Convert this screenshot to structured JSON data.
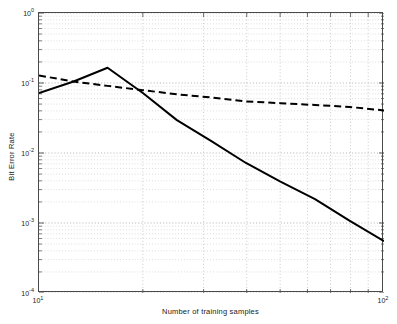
{
  "chart_data": {
    "type": "line",
    "title": "",
    "xlabel": "Number of training samples",
    "ylabel": "Bit Error Rate",
    "xscale": "log",
    "yscale": "log",
    "xlim": [
      10,
      100
    ],
    "ylim": [
      0.0001,
      1
    ],
    "grid": true,
    "grid_style": "dotted",
    "legend": "none",
    "xticks": [
      10,
      100
    ],
    "xticklabels": [
      "10^1",
      "10^2"
    ],
    "xtick_sup": [
      "1",
      "2"
    ],
    "xtick_base": [
      "10",
      "10"
    ],
    "xminorticks": [
      20,
      30,
      40,
      50,
      60,
      70,
      80,
      90
    ],
    "yticks": [
      1,
      0.1,
      0.01,
      0.001,
      0.0001
    ],
    "ytick_base": [
      "10",
      "10",
      "10",
      "10",
      "10"
    ],
    "ytick_sup": [
      "0",
      "-1",
      "-2",
      "-3",
      "-4"
    ],
    "series": [
      {
        "name": "solid-curve",
        "style": "solid",
        "color": "#000000",
        "width": 2.0,
        "x": [
          10,
          12.6,
          15.8,
          20,
          25.1,
          31.6,
          39.8,
          50.1,
          63.1,
          79.4,
          100
        ],
        "y": [
          0.072,
          0.105,
          0.165,
          0.072,
          0.0295,
          0.0148,
          0.0072,
          0.0039,
          0.0022,
          0.00108,
          0.00055
        ]
      },
      {
        "name": "dashed-curve",
        "style": "dashed",
        "color": "#000000",
        "width": 2.0,
        "x": [
          10,
          12.6,
          15.8,
          20,
          25.1,
          31.6,
          39.8,
          50.1,
          63.1,
          79.4,
          100
        ],
        "y": [
          0.128,
          0.105,
          0.091,
          0.079,
          0.069,
          0.062,
          0.0545,
          0.0515,
          0.0485,
          0.0455,
          0.0405
        ]
      }
    ]
  }
}
